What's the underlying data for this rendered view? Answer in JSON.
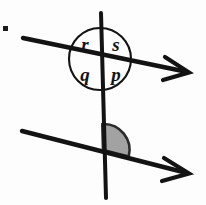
{
  "figure": {
    "background_color": "#fdfdfd",
    "stroke_color": "#131313",
    "shade_color": "#9a9a9a",
    "shade_stroke_color": "#2a2a2a",
    "circle": {
      "center_x": 100,
      "center_y": 59,
      "radius": 31,
      "stroke_width": 2.1
    },
    "angle_labels": [
      {
        "name": "r",
        "text": "r",
        "quadrant": "top-left",
        "x": 85,
        "y": 51
      },
      {
        "name": "s",
        "text": "s",
        "quadrant": "top-right",
        "x": 115,
        "y": 51
      },
      {
        "name": "q",
        "text": "q",
        "quadrant": "bottom-left",
        "x": 85,
        "y": 79
      },
      {
        "name": "p",
        "text": "p",
        "quadrant": "bottom-right",
        "x": 115,
        "y": 79
      }
    ],
    "lines": [
      {
        "name": "vertical-transversal",
        "kind": "transversal",
        "x1": 101,
        "y1": 13,
        "x2": 106,
        "y2": 198,
        "stroke_width": 4.0,
        "arrow": "none"
      },
      {
        "name": "upper-parallel-line",
        "kind": "parallel",
        "x1": 23,
        "y1": 38,
        "x2": 188,
        "y2": 72,
        "stroke_width": 4.4,
        "arrow": "end"
      },
      {
        "name": "lower-parallel-line",
        "kind": "parallel",
        "x1": 22,
        "y1": 131,
        "x2": 188,
        "y2": 173,
        "stroke_width": 4.4,
        "arrow": "end"
      }
    ],
    "intersections": [
      {
        "name": "upper-intersection",
        "x": 100,
        "y": 59
      },
      {
        "name": "lower-intersection",
        "x": 103,
        "y": 150
      }
    ],
    "shaded_angle": {
      "name": "shaded-angle-sector",
      "center_x": 103,
      "center_y": 150,
      "radius": 26,
      "start_label": "vertical-up",
      "end_label": "lower-line-right",
      "fill": "#9a9a9a",
      "opacity": 0.92
    },
    "arrowheads": [
      {
        "name": "upper-line-arrowhead",
        "tip_x": 188,
        "tip_y": 72
      },
      {
        "name": "lower-line-arrowhead",
        "tip_x": 188,
        "tip_y": 173
      }
    ],
    "stray_mark": {
      "name": "stray-ink-dot",
      "x": 4,
      "y": 27,
      "width": 5,
      "height": 5,
      "color": "#1c1c1c"
    }
  }
}
